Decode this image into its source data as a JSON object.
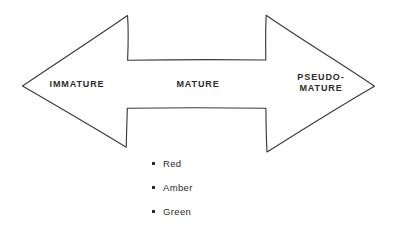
{
  "diagram": {
    "type": "double-headed-arrow",
    "stroke_color": "#3a3a3a",
    "background_color": "#ffffff",
    "text_color": "#2b2b2b",
    "stages": [
      {
        "id": "immature",
        "label": "IMMATURE"
      },
      {
        "id": "mature",
        "label": "MATURE"
      },
      {
        "id": "pseudo-mature",
        "label": "PSEUDO-\nMATURE"
      }
    ]
  },
  "legend": {
    "items": [
      {
        "id": "red",
        "label": "Red",
        "bullet": "square-bullet-icon"
      },
      {
        "id": "amber",
        "label": "Amber",
        "bullet": "square-bullet-icon"
      },
      {
        "id": "green",
        "label": "Green",
        "bullet": "square-bullet-icon"
      }
    ]
  }
}
